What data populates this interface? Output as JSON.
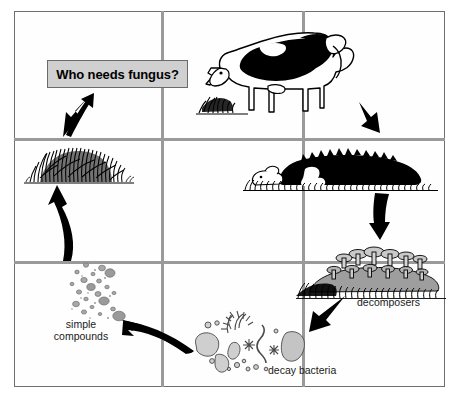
{
  "diagram": {
    "title_box": {
      "text": "Who needs fungus?",
      "fill_color": "#d0d0d0",
      "border_color": "#6a6a6a"
    },
    "frame": {
      "border_color": "#6f6f6f",
      "grid_color": "#9a9a9a",
      "background": "#ffffff",
      "columns": 3,
      "rows": 3
    },
    "labels": {
      "simple_compounds": "simple compounds",
      "decay_bacteria": "decay bacteria",
      "decomposers": "decomposers"
    },
    "stages": [
      {
        "name": "living-cow-grazing",
        "cell": "top-right",
        "description": "Holstein cow grazing on grass"
      },
      {
        "name": "dead-cow",
        "cell": "middle-right",
        "description": "Dead cow lying in grass"
      },
      {
        "name": "mushrooms-decomposers",
        "cell": "bottom-right",
        "description": "Mushrooms growing on decaying mound"
      },
      {
        "name": "decay-bacteria",
        "cell": "bottom-center",
        "description": "Microbes and bacteria shapes"
      },
      {
        "name": "simple-compounds",
        "cell": "bottom-left",
        "description": "Scattered gray particles"
      },
      {
        "name": "grass-tuft",
        "cell": "middle-left",
        "description": "Tuft of new grass"
      }
    ],
    "arrows": [
      {
        "name": "arrow-cow-to-dead-cow",
        "direction": "down-right"
      },
      {
        "name": "arrow-dead-cow-to-decomposers",
        "direction": "down"
      },
      {
        "name": "arrow-decomposers-to-bacteria",
        "direction": "down-left"
      },
      {
        "name": "arrow-bacteria-to-compounds",
        "direction": "left-up"
      },
      {
        "name": "arrow-compounds-to-grass",
        "direction": "up"
      },
      {
        "name": "arrow-grass-to-title",
        "direction": "up-right"
      }
    ],
    "colors": {
      "ink": "#000000",
      "grid": "#9a9a9a",
      "gray_fill": "#9e9e9e",
      "light_gray_fill": "#c9c9c9"
    }
  }
}
